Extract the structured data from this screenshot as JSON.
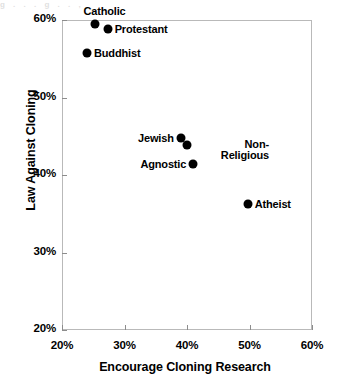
{
  "scan_artifact": {
    "text": "g      .   .  .     g        .     .      ,"
  },
  "chart_data": {
    "type": "scatter",
    "title": "",
    "xlabel": "Encourage Cloning Research",
    "ylabel": "Law Against Cloning",
    "xlim": [
      20,
      60
    ],
    "ylim": [
      20,
      60
    ],
    "xticks": [
      "20%",
      "30%",
      "40%",
      "50%",
      "60%"
    ],
    "yticks": [
      "20%",
      "30%",
      "40%",
      "50%",
      "60%"
    ],
    "xtick_values": [
      20,
      30,
      40,
      50,
      60
    ],
    "ytick_values": [
      20,
      30,
      40,
      50,
      60
    ],
    "grid": false,
    "legend": "none",
    "marker": "filled-circle",
    "marker_color": "#000000",
    "points": [
      {
        "label": "Catholic",
        "x": 25.2,
        "y": 59.5,
        "label_pos": "above"
      },
      {
        "label": "Protestant",
        "x": 27.3,
        "y": 58.8,
        "label_pos": "right"
      },
      {
        "label": "Buddhist",
        "x": 24.0,
        "y": 55.8,
        "label_pos": "right"
      },
      {
        "label": "Jewish",
        "x": 39.0,
        "y": 44.8,
        "label_pos": "left"
      },
      {
        "label": "Non-Religious",
        "x": 40.0,
        "y": 43.9,
        "label_pos": "right"
      },
      {
        "label": "Agnostic",
        "x": 41.0,
        "y": 41.4,
        "label_pos": "left"
      },
      {
        "label": "Atheist",
        "x": 49.7,
        "y": 36.3,
        "label_pos": "right"
      }
    ]
  }
}
